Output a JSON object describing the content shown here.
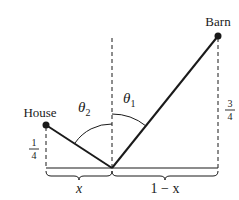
{
  "diagram": {
    "labels": {
      "house": "House",
      "barn": "Barn",
      "theta1_base": "θ",
      "theta1_sub": "1",
      "theta2_base": "θ",
      "theta2_sub": "2",
      "house_height_num": "1",
      "house_height_den": "4",
      "barn_height_num": "3",
      "barn_height_den": "4",
      "left_segment": "x",
      "right_segment": "1 − x"
    },
    "points": {
      "house": {
        "x": 46,
        "y": 125
      },
      "barn": {
        "x": 218,
        "y": 36
      },
      "vertex": {
        "x": 112,
        "y": 168
      }
    },
    "colors": {
      "ink": "#1a1a1a",
      "background": "#ffffff"
    }
  }
}
